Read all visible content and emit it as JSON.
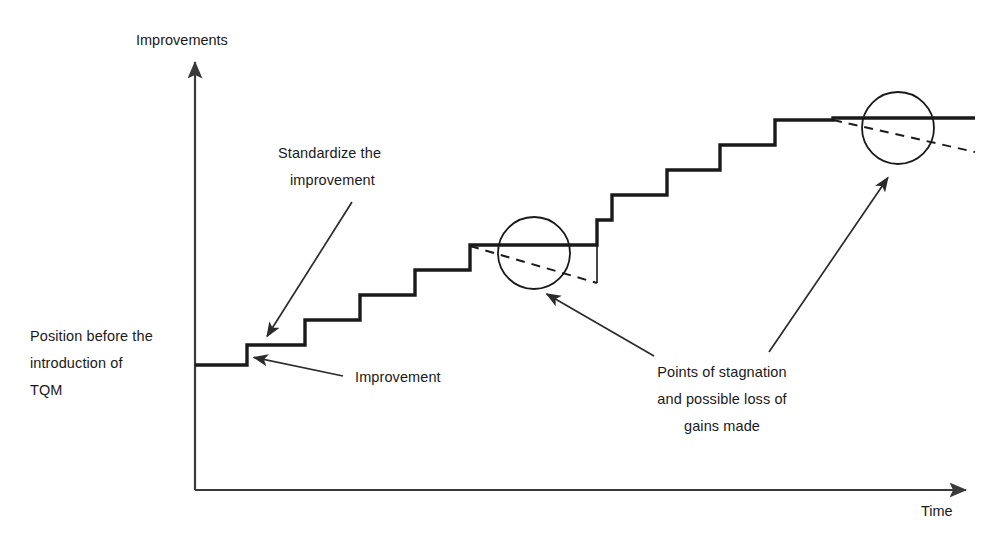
{
  "diagram": {
    "title_axis_y": "Improvements",
    "title_axis_x": "Time",
    "labels": {
      "position_before_line1": "Position before the",
      "position_before_line2": "introduction of",
      "position_before_line3": "TQM",
      "standardize_line1": "Standardize the",
      "standardize_line2": "improvement",
      "improvement": "Improvement",
      "stagnation_line1": "Points of stagnation",
      "stagnation_line2": "and possible loss of",
      "stagnation_line3": "gains made"
    },
    "colors": {
      "ink": "#1a1a1a",
      "axis": "#3a3a3a",
      "background": "#ffffff"
    }
  },
  "chart_data": {
    "type": "line",
    "title": "",
    "xlabel": "Time",
    "ylabel": "Improvements",
    "grid": false,
    "legend": null,
    "axis_origin": [
      195,
      490
    ],
    "axis_x_end": [
      975,
      490
    ],
    "axis_y_top": [
      195,
      58
    ],
    "step_points": [
      [
        195,
        365
      ],
      [
        247,
        365
      ],
      [
        247,
        345
      ],
      [
        305,
        345
      ],
      [
        305,
        320
      ],
      [
        360,
        320
      ],
      [
        360,
        295
      ],
      [
        415,
        295
      ],
      [
        415,
        270
      ],
      [
        470,
        270
      ],
      [
        470,
        245
      ],
      [
        597,
        245
      ],
      [
        597,
        220
      ],
      [
        612,
        220
      ],
      [
        612,
        195
      ],
      [
        667,
        195
      ],
      [
        667,
        170
      ],
      [
        720,
        170
      ],
      [
        720,
        145
      ],
      [
        775,
        145
      ],
      [
        775,
        120
      ],
      [
        833,
        120
      ],
      [
        833,
        118
      ],
      [
        975,
        118
      ]
    ],
    "decline_lines": [
      {
        "name": "stagnation-decline-1",
        "from": [
          470,
          246
        ],
        "to": [
          597,
          283
        ]
      },
      {
        "name": "stagnation-decline-2",
        "from": [
          833,
          120
        ],
        "to": [
          975,
          152
        ]
      }
    ],
    "drop_lines": [
      {
        "name": "stagnation-drop-1",
        "from": [
          597,
          245
        ],
        "to": [
          597,
          283
        ]
      }
    ],
    "stagnation_markers": [
      {
        "name": "stagnation-circle-1",
        "cx": 534,
        "cy": 253,
        "r": 36
      },
      {
        "name": "stagnation-circle-2",
        "cx": 898,
        "cy": 128,
        "r": 36
      }
    ],
    "annotations": [
      {
        "name": "standardize",
        "text": "Standardize the improvement",
        "arrow_from": [
          352,
          202
        ],
        "arrow_to": [
          266,
          338
        ]
      },
      {
        "name": "improvement",
        "text": "Improvement",
        "arrow_from": [
          343,
          376
        ],
        "arrow_to": [
          252,
          357
        ]
      },
      {
        "name": "stagnation-left",
        "text": "Points of stagnation and possible loss of gains made",
        "arrow_from": [
          654,
          356
        ],
        "arrow_to": [
          545,
          293
        ]
      },
      {
        "name": "stagnation-right",
        "text": "Points of stagnation and possible loss of gains made",
        "arrow_from": [
          769,
          352
        ],
        "arrow_to": [
          889,
          176
        ]
      },
      {
        "name": "position-before",
        "text": "Position before the introduction of TQM",
        "arrow_from": null,
        "arrow_to": null
      }
    ]
  }
}
